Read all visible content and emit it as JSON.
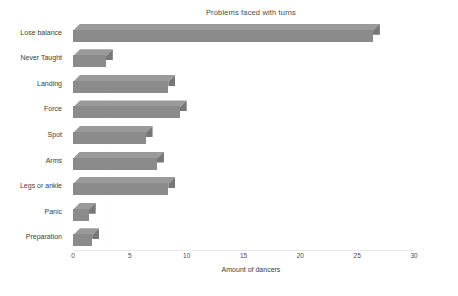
{
  "chart_data": {
    "type": "bar",
    "orientation": "horizontal",
    "title": "Problems faced with turns",
    "xlabel": "Amount of dancers",
    "ylabel": "",
    "xlim": [
      0,
      30
    ],
    "xticks": [
      0,
      5,
      10,
      15,
      20,
      25,
      30
    ],
    "grid": true,
    "legend": null,
    "style": "3d-bar",
    "bar_color": "#8b8b8b",
    "bar_top_color": "#9a9a9a",
    "bar_side_color": "#777777",
    "background": "#ffffff",
    "categories": [
      "Lose balance",
      "Never Taught",
      "Landing",
      "Force",
      "Spot",
      "Arms",
      "Legs or ankle",
      "Panic",
      "Preparation"
    ],
    "values": [
      27,
      3.5,
      9,
      10,
      7,
      8,
      9,
      2,
      2.3
    ]
  }
}
